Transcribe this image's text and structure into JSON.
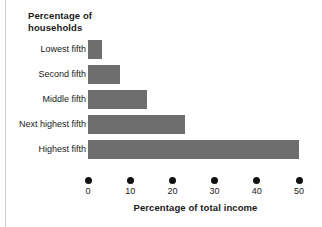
{
  "figure": {
    "width": 322,
    "height": 227,
    "background": "#ffffff",
    "edge_rule_color": "#cfcfcf"
  },
  "title": "Percentage of\nhouseholds",
  "title_line1": "Percentage of",
  "title_line2": "households",
  "x_axis_title": "Percentage of total income",
  "bar_color": "#6e6e6e",
  "axis_marker_color": "#111111",
  "text_color": "#1a1a1a",
  "chart_data": {
    "type": "bar",
    "orientation": "horizontal",
    "title": "Percentage of households",
    "xlabel": "Percentage of total income",
    "ylabel": "Percentage of households",
    "categories": [
      "Lowest fifth",
      "Second fifth",
      "Middle fifth",
      "Next highest fifth",
      "Highest fifth"
    ],
    "values": [
      3.3,
      7.5,
      14.0,
      23.0,
      50.0
    ],
    "xlim": [
      0,
      50
    ],
    "ylim": null,
    "xticks": [
      0,
      10,
      20,
      30,
      40,
      50
    ],
    "xtick_labels": [
      "0",
      "10",
      "20",
      "30",
      "40",
      "50"
    ],
    "grid": false,
    "legend": null,
    "legend_position": "none",
    "tick_marker_style": "dot",
    "annotations": [],
    "series": [
      {
        "name": "Percentage of total income",
        "values": [
          3.3,
          7.5,
          14.0,
          23.0,
          50.0
        ]
      }
    ]
  }
}
